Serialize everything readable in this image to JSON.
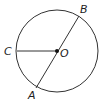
{
  "diagram": {
    "type": "circle-geometry",
    "center": {
      "label": "O",
      "x": 57,
      "y": 51
    },
    "radius": 41,
    "points": [
      {
        "label": "A",
        "x": 36,
        "y": 88,
        "label_x": 28,
        "label_y": 99
      },
      {
        "label": "B",
        "x": 79,
        "y": 16,
        "label_x": 80,
        "label_y": 13
      },
      {
        "label": "C",
        "x": 17,
        "y": 51,
        "label_x": 4,
        "label_y": 55
      }
    ],
    "segments": [
      {
        "from": "A",
        "to": "B",
        "kind": "diameter"
      },
      {
        "from": "C",
        "to": "O",
        "kind": "radius"
      }
    ],
    "stroke_color": "#333333"
  }
}
